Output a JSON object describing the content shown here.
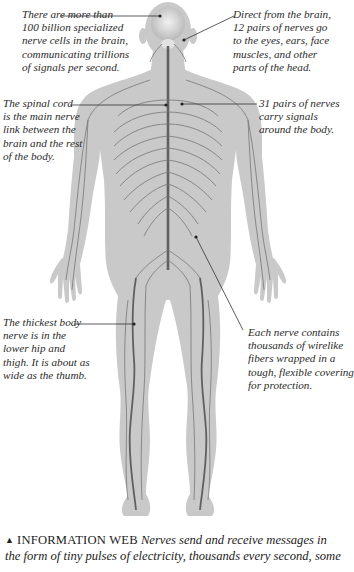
{
  "diagram": {
    "colors": {
      "body_fill": "#c9c9c9",
      "nerve_stroke": "#6e6e6e",
      "spine_stroke": "#555555",
      "leader_line": "#333333",
      "text": "#2b2b2b"
    },
    "callouts": [
      {
        "id": "brain",
        "lines": [
          "There are more than",
          "100 billion specialized",
          "nerve cells in the brain,",
          "communicating trillions",
          "of signals per second."
        ]
      },
      {
        "id": "cranial-nerves",
        "lines": [
          "Direct from the brain,",
          "12 pairs of nerves go",
          "to the eyes, ears, face",
          "muscles, and other",
          "parts of the head."
        ]
      },
      {
        "id": "spinal-cord",
        "lines": [
          "The spinal cord",
          "is the main nerve",
          "link between the",
          "brain and the rest",
          "of the body."
        ]
      },
      {
        "id": "spinal-nerves",
        "lines": [
          "31 pairs of nerves",
          "carry signals",
          "around the body."
        ]
      },
      {
        "id": "sciatic-nerve",
        "lines": [
          "The thickest body",
          "nerve is in the",
          "lower hip and",
          "thigh. It is about as",
          "wide as the thumb."
        ]
      },
      {
        "id": "nerve-fibers",
        "lines": [
          "Each nerve contains",
          "thousands of wirelike",
          "fibers wrapped in a",
          "tough, flexible covering",
          "for protection."
        ]
      }
    ]
  },
  "caption": {
    "marker": "▲",
    "heading": "INFORMATION WEB",
    "text_line1": "Nerves send and receive messages in",
    "text_line2": "the form of tiny pulses of electricity, thousands every second, some"
  }
}
